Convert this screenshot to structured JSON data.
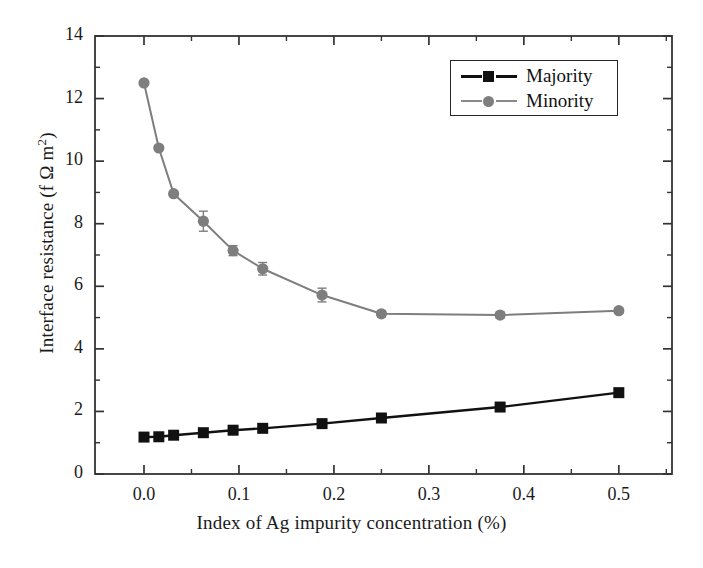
{
  "chart_data": {
    "type": "line",
    "title": "",
    "xlabel": "Index of Ag impurity concentration (%)",
    "ylabel": "Interface resistance (f Ω m²)",
    "ylabel_parts": {
      "pre": "Interface resistance (f Ω m",
      "sup": "2",
      "post": ")"
    },
    "xlim": [
      -0.0516,
      0.556
    ],
    "ylim": [
      0,
      14
    ],
    "xticks": [
      0.0,
      0.1,
      0.2,
      0.3,
      0.4,
      0.5
    ],
    "xtick_labels": [
      "0.0",
      "0.1",
      "0.2",
      "0.3",
      "0.4",
      "0.5"
    ],
    "xminor_step": 0.05,
    "yticks": [
      0,
      2,
      4,
      6,
      8,
      10,
      12,
      14
    ],
    "ytick_labels": [
      "0",
      "2",
      "4",
      "6",
      "8",
      "10",
      "12",
      "14"
    ],
    "yminor_step": 1,
    "grid": false,
    "legend_position": "upper right",
    "frame": true,
    "tick_direction": "in",
    "series": [
      {
        "name": "Majority",
        "marker": "square",
        "color": "#111111",
        "linewidth": 2.4,
        "x": [
          0.0,
          0.0156,
          0.0312,
          0.0625,
          0.0938,
          0.125,
          0.1875,
          0.25,
          0.375,
          0.5
        ],
        "values": [
          1.18,
          1.19,
          1.24,
          1.32,
          1.4,
          1.46,
          1.61,
          1.79,
          2.14,
          2.6
        ],
        "errors": [
          0,
          0,
          0,
          0,
          0,
          0,
          0,
          0,
          0,
          0
        ]
      },
      {
        "name": "Minority",
        "marker": "circle",
        "color": "#7e7e7e",
        "linewidth": 2.0,
        "x": [
          0.0,
          0.0156,
          0.0312,
          0.0625,
          0.0938,
          0.125,
          0.1875,
          0.25,
          0.375,
          0.5
        ],
        "values": [
          12.5,
          10.42,
          8.96,
          8.08,
          7.14,
          6.56,
          5.72,
          5.12,
          5.08,
          5.22
        ],
        "errors": [
          0.0,
          0.0,
          0.0,
          0.32,
          0.16,
          0.2,
          0.22,
          0.1,
          0.1,
          0.08
        ]
      }
    ]
  },
  "legend": {
    "items": [
      {
        "label": "Majority",
        "marker": "square",
        "color": "#111111"
      },
      {
        "label": "Minority",
        "marker": "circle",
        "color": "#7e7e7e"
      }
    ]
  },
  "colors": {
    "majority": "#111111",
    "minority": "#7e7e7e",
    "axis": "#333333",
    "background": "#ffffff",
    "text": "#1a1a1a"
  }
}
